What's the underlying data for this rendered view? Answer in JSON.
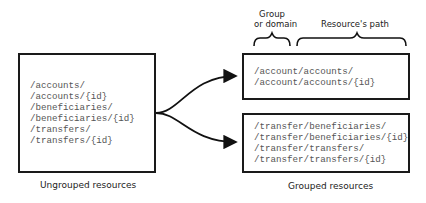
{
  "ungrouped": {
    "caption": "Ungrouped resources",
    "paths": [
      "/accounts/",
      "/accounts/{id}",
      "/beneficiaries/",
      "/beneficiaries/{id}",
      "/transfers/",
      "/transfers/{id}"
    ]
  },
  "grouped": {
    "caption": "Grouped resources",
    "header_group_line1": "Group",
    "header_group_line2": "or domain",
    "header_path": "Resource's path",
    "groups": [
      {
        "name": "account",
        "paths": [
          "/account/accounts/",
          "/account/accounts/{id}"
        ]
      },
      {
        "name": "transfer",
        "paths": [
          "/transfer/beneficiaries/",
          "/transfer/beneficiaries/{id}",
          "/transfer/transfers/",
          "/transfer/transfers/{id}"
        ]
      }
    ]
  }
}
